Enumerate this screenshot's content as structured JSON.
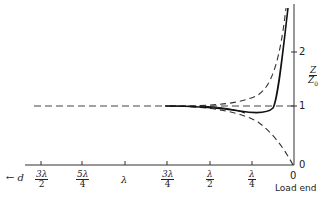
{
  "figure": {
    "y_axis": {
      "label_num": "Z",
      "label_den": "Z",
      "label_den_sub": "0",
      "ticks": [
        {
          "label": "2",
          "value": 2
        },
        {
          "label": "1",
          "value": 1
        },
        {
          "label": "0",
          "value": 0
        }
      ]
    },
    "x_axis": {
      "direction_label": "← d",
      "arrow": "←",
      "var": "d",
      "ticks": [
        {
          "num": "3λ",
          "den": "2"
        },
        {
          "num": "5λ",
          "den": "4"
        },
        {
          "num": "λ",
          "den": ""
        },
        {
          "num": "3λ",
          "den": "4"
        },
        {
          "num": "λ",
          "den": "2"
        },
        {
          "num": "λ",
          "den": "4"
        },
        {
          "num": "0",
          "den": ""
        }
      ],
      "end_label": "Load end"
    },
    "curves": [
      {
        "name": "dashed-upper",
        "style": "dashed",
        "description": "Impedance rising from Z0 to high value near load"
      },
      {
        "name": "dashed-lower",
        "style": "dashed",
        "description": "Impedance falling from Z0 to 0 at load"
      },
      {
        "name": "solid",
        "style": "solid",
        "description": "Impedance dipping slightly below Z0 then rising steeply near load"
      },
      {
        "name": "dashed-reference",
        "style": "dashed",
        "description": "Z/Z0 = 1 reference line"
      }
    ]
  }
}
